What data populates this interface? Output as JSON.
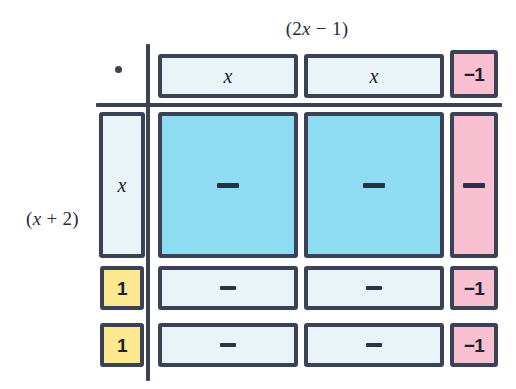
{
  "diagram": {
    "kind": "algebra-tile-area-model",
    "top_label": "(2x − 1)",
    "left_label": "(x + 2)",
    "corner_marker": "dot",
    "colors": {
      "outline": "#3c4256",
      "pale": "#e9f3f8",
      "blue": "#8ddcf2",
      "pink": "#f9c0d2",
      "yellow": "#fbe88f",
      "text": "#1d2230",
      "background": "#ffffff"
    },
    "column_headers": [
      {
        "id": "col-1",
        "label": "x",
        "tone": "pale",
        "shape": "x-strip"
      },
      {
        "id": "col-2",
        "label": "x",
        "tone": "pale",
        "shape": "x-strip"
      },
      {
        "id": "col-3",
        "label": "−1",
        "tone": "pink",
        "shape": "unit"
      }
    ],
    "row_headers": [
      {
        "id": "row-1",
        "label": "x",
        "tone": "pale",
        "shape": "x-strip"
      },
      {
        "id": "row-2",
        "label": "1",
        "tone": "yellow",
        "shape": "unit"
      },
      {
        "id": "row-3",
        "label": "1",
        "tone": "yellow",
        "shape": "unit"
      }
    ],
    "body": [
      [
        {
          "id": "r1c1",
          "label": "—",
          "tone": "blue",
          "size": "large",
          "mark": "dash"
        },
        {
          "id": "r1c2",
          "label": "—",
          "tone": "blue",
          "size": "large",
          "mark": "dash"
        },
        {
          "id": "r1c3",
          "label": "—",
          "tone": "pink",
          "size": "tall",
          "mark": "dash"
        }
      ],
      [
        {
          "id": "r2c1",
          "label": "—",
          "tone": "pale",
          "size": "wide",
          "mark": "dash"
        },
        {
          "id": "r2c2",
          "label": "—",
          "tone": "pale",
          "size": "wide",
          "mark": "dash"
        },
        {
          "id": "r2c3",
          "label": "−1",
          "tone": "pink",
          "size": "unit",
          "mark": "text"
        }
      ],
      [
        {
          "id": "r3c1",
          "label": "—",
          "tone": "pale",
          "size": "wide",
          "mark": "dash"
        },
        {
          "id": "r3c2",
          "label": "—",
          "tone": "pale",
          "size": "wide",
          "mark": "dash"
        },
        {
          "id": "r3c3",
          "label": "−1",
          "tone": "pink",
          "size": "unit",
          "mark": "text"
        }
      ]
    ]
  }
}
